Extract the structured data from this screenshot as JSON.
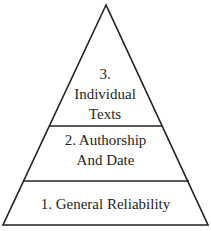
{
  "diagram": {
    "type": "pyramid",
    "stroke_color": "#222222",
    "background": "#ffffff",
    "tiers": [
      {
        "level": 1,
        "lines": [
          "1. General Reliability"
        ]
      },
      {
        "level": 2,
        "lines": [
          "2. Authorship",
          "And Date"
        ]
      },
      {
        "level": 3,
        "lines": [
          "3.",
          "Individual",
          "Texts"
        ]
      }
    ]
  }
}
